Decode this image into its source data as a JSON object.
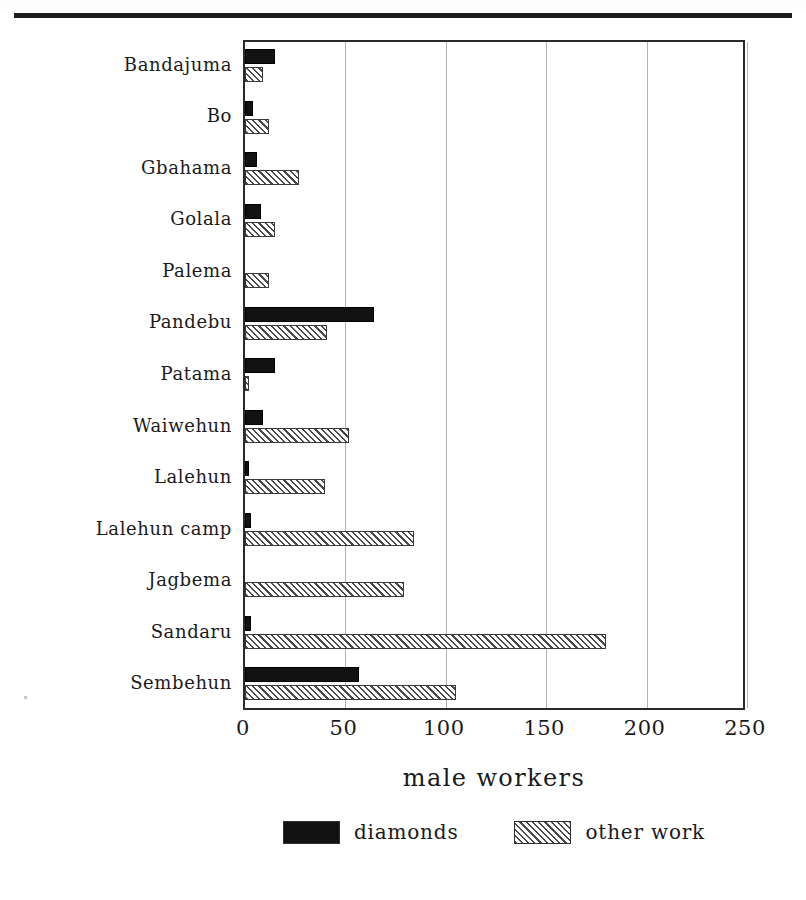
{
  "page": {
    "header_text": "",
    "header_note": "faint cropped running head at top of scanned page"
  },
  "chart_data": {
    "type": "bar",
    "orientation": "horizontal",
    "title": "",
    "xlabel": "male workers",
    "ylabel": "",
    "xlim": [
      0,
      250
    ],
    "xticks": [
      0,
      50,
      100,
      150,
      200,
      250
    ],
    "xticklabels": [
      "0",
      "50",
      "100",
      "150",
      "200",
      "250"
    ],
    "grid": "vertical",
    "legend_position": "bottom-center",
    "categories": [
      "Bandajuma",
      "Bo",
      "Gbahama",
      "Golala",
      "Palema",
      "Pandebu",
      "Patama",
      "Waiwehun",
      "Lalehun",
      "Lalehun camp",
      "Jagbema",
      "Sandaru",
      "Sembehun"
    ],
    "series": [
      {
        "name": "diamonds",
        "color": "#121212",
        "pattern": "solid",
        "values": [
          15,
          4,
          6,
          8,
          0,
          64,
          15,
          9,
          2,
          3,
          0,
          3,
          57
        ]
      },
      {
        "name": "other work",
        "color": "#4a4a4a",
        "pattern": "diagonal-hatch",
        "values": [
          9,
          12,
          27,
          15,
          12,
          41,
          2,
          52,
          40,
          84,
          79,
          180,
          105
        ]
      }
    ]
  }
}
